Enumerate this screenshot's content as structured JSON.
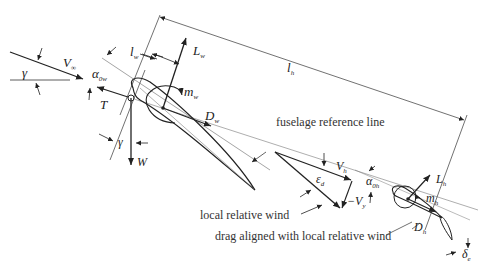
{
  "diagram": {
    "colors": {
      "line": "#222222",
      "thin": "#555555",
      "background": "#ffffff"
    },
    "symbols": {
      "gamma_top": "γ",
      "gamma_bottom": "γ",
      "V_inf": {
        "main": "V",
        "sub": "∞"
      },
      "alpha_0w": {
        "main": "α",
        "sub": "0w"
      },
      "T": "T",
      "W": "W",
      "l_w": {
        "main": "l",
        "sub": "w"
      },
      "L_w": {
        "main": "L",
        "sub": "w"
      },
      "m_w": {
        "main": "m",
        "sub": "w"
      },
      "D_w": {
        "main": "D",
        "sub": "w"
      },
      "l_h": {
        "main": "l",
        "sub": "h"
      },
      "V_h": {
        "main": "V",
        "sub": "h"
      },
      "eps_d": {
        "main": "ε",
        "sub": "d"
      },
      "neg_V_y": {
        "main": "−V",
        "sub": "y"
      },
      "alpha_0h": {
        "main": "α",
        "sub": "0h"
      },
      "L_h": {
        "main": "L",
        "sub": "h"
      },
      "m_h": {
        "main": "m",
        "sub": "h"
      },
      "D_h": {
        "main": "D",
        "sub": "h"
      },
      "delta_e": {
        "main": "δ",
        "sub": "e"
      }
    },
    "annotations": {
      "fuselage_ref": "fuselage reference line",
      "local_wind": "local relative wind",
      "drag_aligned": "drag aligned with local relative wind"
    }
  }
}
